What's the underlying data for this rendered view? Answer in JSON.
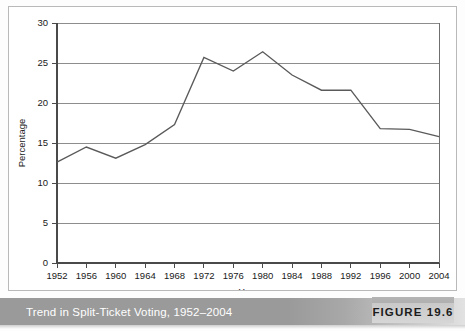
{
  "figure": {
    "caption": "Trend in Split-Ticket Voting, 1952–2004",
    "badge_label": "FIGURE 19.6"
  },
  "chart_data": {
    "type": "line",
    "title": "",
    "xlabel": "Year",
    "ylabel": "Percentage",
    "categories": [
      "1952",
      "1956",
      "1960",
      "1964",
      "1968",
      "1972",
      "1976",
      "1980",
      "1984",
      "1988",
      "1992",
      "1996",
      "2000",
      "2004"
    ],
    "values": [
      12.6,
      14.5,
      13.1,
      14.8,
      17.3,
      25.7,
      24.0,
      26.4,
      23.5,
      21.6,
      21.6,
      16.8,
      16.7,
      15.8
    ],
    "series": [
      {
        "name": "Split-ticket voting",
        "values": [
          12.6,
          14.5,
          13.1,
          14.8,
          17.3,
          25.7,
          24.0,
          26.4,
          23.5,
          21.6,
          21.6,
          16.8,
          16.7,
          15.8
        ]
      }
    ],
    "ylim": [
      0,
      30
    ],
    "yticks": [
      0,
      5,
      10,
      15,
      20,
      25,
      30
    ],
    "ytick_labels": [
      "0",
      "5",
      "10",
      "15",
      "20",
      "25",
      "30"
    ],
    "grid": true,
    "grid_axis": "y",
    "legend": false,
    "markers": false,
    "line_color": "#5a5a5a",
    "grid_color": "#8d8d8d",
    "axis_color": "#4a4a4a",
    "plot_background": "#ffffff"
  }
}
